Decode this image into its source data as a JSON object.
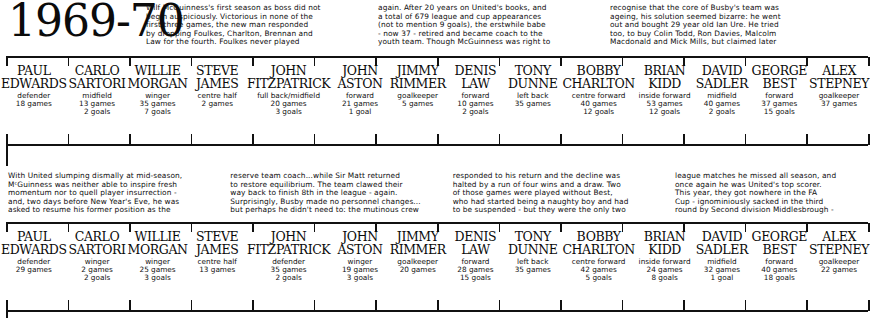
{
  "title": "1969-70",
  "prose_top": [
    "Wilf McGuinness's first season as boss did not\nbegin auspiciously.  Victorious in none of the\nfirst three games, the new man responded\nby dropping Foulkes, Charlton, Brennan and\nLaw for the fourth.  Foulkes never played",
    "again. After 20 years on United's books, and\na total of 679 league and cup appearances\n(not to mention 9 goals), the erstwhile babe\n- now 37 - retired and became coach to the\nyouth team.  Though McGuinness was right to",
    "recognise that the core of Busby's team was\nageing, his solution seemed bizarre: he went\nout and bought 29 year old Ian Ure. He tried\ntoo, to buy Colin Todd, Ron Davies, Malcolm\nMacdonald and Mick Mills, but claimed later"
  ],
  "prose_mid": [
    "With United slumping dismally at mid-season,\nMᶜGuinness was neither able to inspire fresh\nmomentum nor to quell player insurrection -\nand, two days before New Year's Eve, he was\nasked to resume his former position as the",
    "reserve team coach...while Sir Matt returned\nto restore equilibrium.  The team clawed their\nway back to finish 8th in the league - again.\nSurprisingly, Busby made no personnel changes...\nbut perhaps he didn't need to: the mutinous crew",
    "responded to his return and the decline was\nhalted by a run of four wins and a draw. Two\nof those games were played without Best,\nwho had started being a naughty boy and had\nto be suspended - but they were the only two",
    "league matches he missed all season, and\nonce again he was United's top scorer.\nThis year, they got nowhere in the FA\nCup - ignominiously sacked in the third\nround by Second division Middlesbrough -"
  ],
  "squad_row_1": [
    {
      "name": "PAUL\nEDWARDS",
      "stats": "defender\n18 games"
    },
    {
      "name": "CARLO\nSARTORI",
      "stats": "midfield\n13 games\n2 goals"
    },
    {
      "name": "WILLIE\nMORGAN",
      "stats": "winger\n35 games\n7 goals"
    },
    {
      "name": "STEVE\nJAMES",
      "stats": "centre half\n2 games"
    },
    {
      "name": "JOHN\nFITZPATRICK",
      "stats": "full back/midfield\n20 games\n3 goals"
    },
    {
      "name": "JOHN\nASTON",
      "stats": "forward\n21 games\n1 goal"
    },
    {
      "name": "JIMMY\nRIMMER",
      "stats": "goalkeeper\n5 games"
    },
    {
      "name": "DENIS\nLAW",
      "stats": "forward\n10 games\n2 goals"
    },
    {
      "name": "TONY\nDUNNE",
      "stats": "left back\n35 games"
    },
    {
      "name": "BOBBY\nCHARLTON",
      "stats": "centre forward\n40 games\n12 goals"
    },
    {
      "name": "BRIAN\nKIDD",
      "stats": "inside forward\n53 games\n12 goals"
    },
    {
      "name": "DAVID\nSADLER",
      "stats": "midfield\n40 games\n2 goals"
    },
    {
      "name": "GEORGE\nBEST",
      "stats": "forward\n37 games\n15 goals"
    },
    {
      "name": "ALEX\nSTEPNEY",
      "stats": "goalkeeper\n37 games"
    }
  ],
  "squad_row_2": [
    {
      "name": "PAUL\nEDWARDS",
      "stats": "defender\n29 games"
    },
    {
      "name": "CARLO\nSARTORI",
      "stats": "winger\n2 games\n2 goals"
    },
    {
      "name": "WILLIE\nMORGAN",
      "stats": "winger\n25 games\n3 goals"
    },
    {
      "name": "STEVE\nJAMES",
      "stats": "centre half\n13 games"
    },
    {
      "name": "JOHN\nFITZPATRICK",
      "stats": "defender\n35 games\n2 goals"
    },
    {
      "name": "JOHN\nASTON",
      "stats": "winger\n19 games\n3 goals"
    },
    {
      "name": "JIMMY\nRIMMER",
      "stats": "goalkeeper\n20 games"
    },
    {
      "name": "DENIS\nLAW",
      "stats": "forward\n28 games\n15 goals"
    },
    {
      "name": "TONY\nDUNNE",
      "stats": "left back\n35 games"
    },
    {
      "name": "BOBBY\nCHARLTON",
      "stats": "centre forward\n42 games\n5 goals"
    },
    {
      "name": "BRIAN\nKIDD",
      "stats": "inside forward\n24 games\n8 goals"
    },
    {
      "name": "DAVID\nSADLER",
      "stats": "midfield\n32 games\n1 goal"
    },
    {
      "name": "GEORGE\nBEST",
      "stats": "forward\n40 games\n18 goals"
    },
    {
      "name": "ALEX\nSTEPNEY",
      "stats": "goalkeeper\n22 games"
    }
  ]
}
